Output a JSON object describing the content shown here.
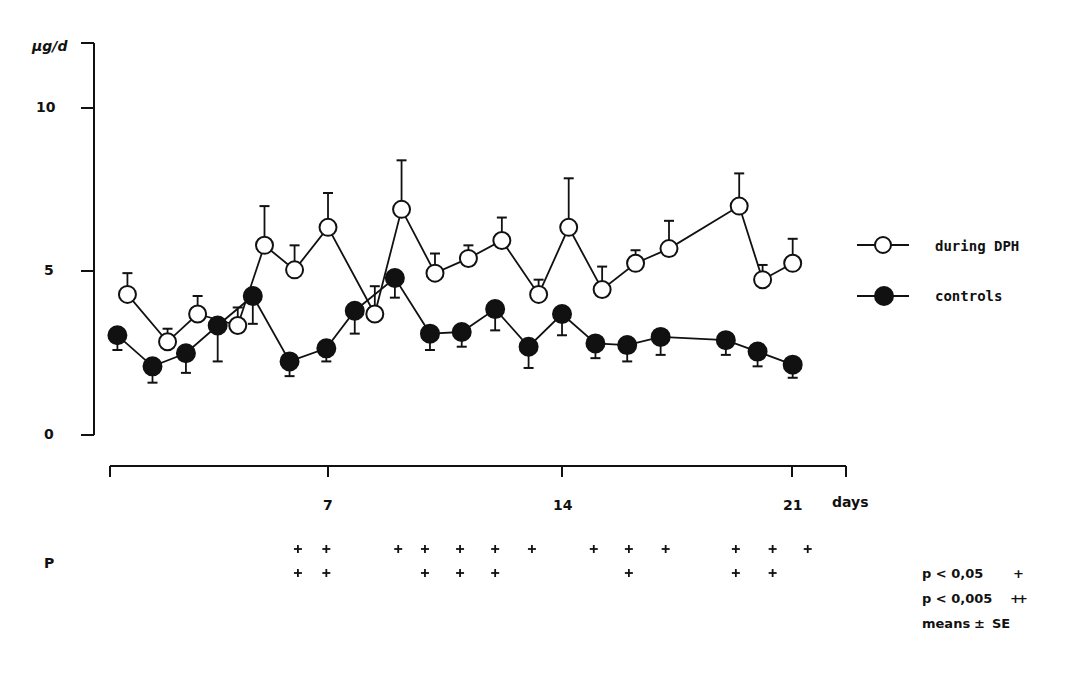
{
  "chart_data": {
    "type": "line",
    "title": "",
    "ylabel": "µg/d",
    "xlabel": "days",
    "ylim": [
      0,
      11
    ],
    "xlim": [
      0.5,
      22.5
    ],
    "y_ticks": [
      0,
      5,
      10
    ],
    "x_ticks": [
      7,
      14,
      21
    ],
    "grid": false,
    "legend_position": "right",
    "error_bars": "means ± SE",
    "series": [
      {
        "name": "during DPH",
        "marker": "open-circle",
        "points": [
          {
            "day": 1.0,
            "value": 4.3,
            "se": 0.65
          },
          {
            "day": 2.2,
            "value": 2.85,
            "se": 0.4
          },
          {
            "day": 3.1,
            "value": 3.7,
            "se": 0.55
          },
          {
            "day": 4.3,
            "value": 3.35,
            "se": 0.55
          },
          {
            "day": 5.1,
            "value": 5.8,
            "se": 1.2
          },
          {
            "day": 6.0,
            "value": 5.05,
            "se": 0.75
          },
          {
            "day": 7.0,
            "value": 6.35,
            "se": 1.05
          },
          {
            "day": 8.4,
            "value": 3.7,
            "se": 0.85
          },
          {
            "day": 9.2,
            "value": 6.9,
            "se": 1.5
          },
          {
            "day": 10.2,
            "value": 4.95,
            "se": 0.6
          },
          {
            "day": 11.2,
            "value": 5.4,
            "se": 0.4
          },
          {
            "day": 12.2,
            "value": 5.95,
            "se": 0.7
          },
          {
            "day": 13.3,
            "value": 4.3,
            "se": 0.45
          },
          {
            "day": 14.2,
            "value": 6.35,
            "se": 1.5
          },
          {
            "day": 15.2,
            "value": 4.45,
            "se": 0.7
          },
          {
            "day": 16.2,
            "value": 5.25,
            "se": 0.4
          },
          {
            "day": 17.2,
            "value": 5.7,
            "se": 0.85
          },
          {
            "day": 19.3,
            "value": 7.0,
            "se": 1.0
          },
          {
            "day": 20.0,
            "value": 4.75,
            "se": 0.45
          },
          {
            "day": 20.9,
            "value": 5.25,
            "se": 0.75
          }
        ]
      },
      {
        "name": "controls",
        "marker": "filled-circle",
        "points": [
          {
            "day": 0.7,
            "value": 3.05,
            "se": -0.45
          },
          {
            "day": 1.75,
            "value": 2.1,
            "se": -0.5
          },
          {
            "day": 2.75,
            "value": 2.5,
            "se": -0.6
          },
          {
            "day": 3.7,
            "value": 3.35,
            "se": -1.1
          },
          {
            "day": 4.75,
            "value": 4.25,
            "se": -0.85
          },
          {
            "day": 5.85,
            "value": 2.25,
            "se": -0.45
          },
          {
            "day": 6.95,
            "value": 2.65,
            "se": -0.4
          },
          {
            "day": 7.8,
            "value": 3.8,
            "se": -0.7
          },
          {
            "day": 9.0,
            "value": 4.8,
            "se": -0.6
          },
          {
            "day": 10.05,
            "value": 3.1,
            "se": -0.5
          },
          {
            "day": 11.0,
            "value": 3.15,
            "se": -0.45
          },
          {
            "day": 12.0,
            "value": 3.85,
            "se": -0.65
          },
          {
            "day": 13.0,
            "value": 2.7,
            "se": -0.65
          },
          {
            "day": 14.0,
            "value": 3.7,
            "se": -0.65
          },
          {
            "day": 15.0,
            "value": 2.8,
            "se": -0.45
          },
          {
            "day": 15.95,
            "value": 2.75,
            "se": -0.5
          },
          {
            "day": 16.95,
            "value": 3.0,
            "se": -0.55
          },
          {
            "day": 18.9,
            "value": 2.9,
            "se": -0.45
          },
          {
            "day": 19.85,
            "value": 2.55,
            "se": -0.45
          },
          {
            "day": 20.9,
            "value": 2.15,
            "se": -0.4
          }
        ]
      }
    ],
    "significance": {
      "row_label": "P",
      "p_lt_005_days": [
        6.1,
        6.95,
        9.1,
        9.9,
        10.95,
        12.0,
        13.1,
        14.95,
        16.0,
        17.1,
        19.2,
        20.3,
        21.35
      ],
      "p_lt_0005_days": [
        6.1,
        6.95,
        9.9,
        10.95,
        12.0,
        16.0,
        19.2,
        20.3
      ]
    }
  },
  "axes": {
    "y_unit": "µg/d",
    "y_tick_labels": [
      "10",
      "5",
      "0"
    ],
    "x_tick_labels": [
      "7",
      "14",
      "21"
    ],
    "x_unit": "days",
    "p_row_label": "P"
  },
  "legend": {
    "items": [
      {
        "label": "during DPH",
        "marker": "open-circle"
      },
      {
        "label": "controls",
        "marker": "filled-circle"
      }
    ]
  },
  "notes": {
    "p1_label": "p < 0,05",
    "p1_symbol": "+",
    "p2_label": "p < 0,005",
    "p2_symbol": "++",
    "means_label": "means",
    "pm_symbol": "±",
    "se_label": "SE"
  },
  "colors": {
    "ink": "#111111",
    "background": "#ffffff"
  }
}
